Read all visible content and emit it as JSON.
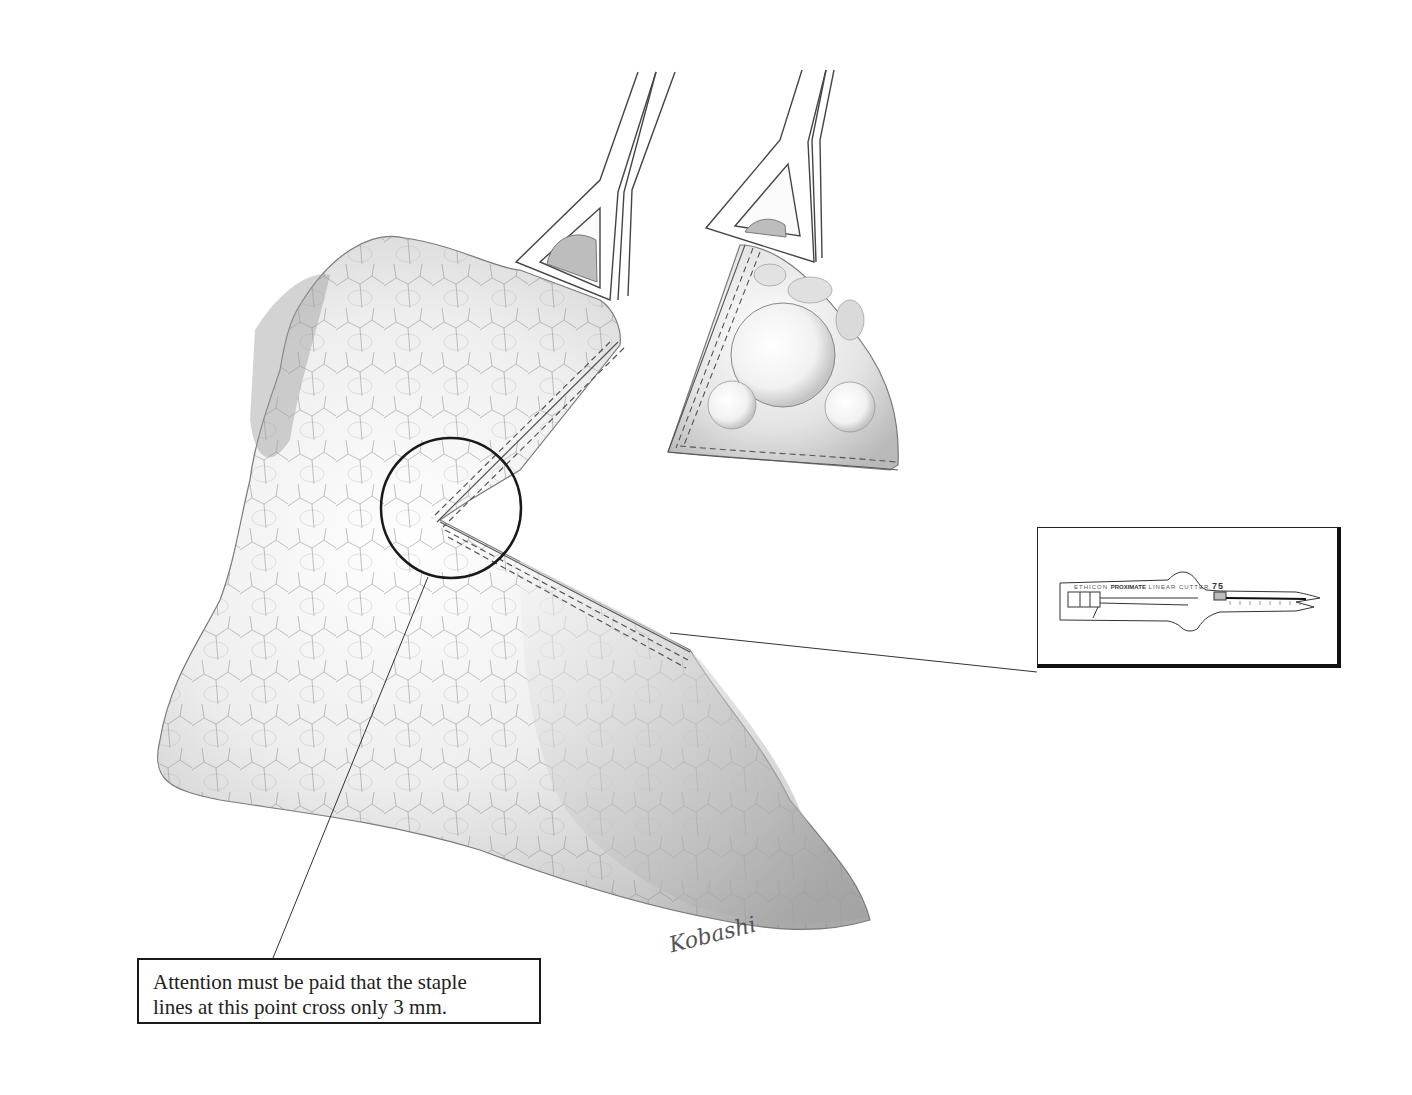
{
  "figure": {
    "type": "surgical-illustration",
    "colors": {
      "background": "#ffffff",
      "outline": "#1a1a1a",
      "tissue_light": "#f2f2f2",
      "tissue_mid": "#cfcfcf",
      "tissue_dark": "#9a9a9a"
    }
  },
  "callout": {
    "line1": "Attention must be paid that the staple",
    "line2": "lines at this point cross only 3 mm."
  },
  "inset": {
    "brand": "ETHICON",
    "product": "PROXIMATE",
    "model": "LINEAR CUTTER",
    "size": "75"
  },
  "signature": {
    "text": "Kobashi"
  }
}
